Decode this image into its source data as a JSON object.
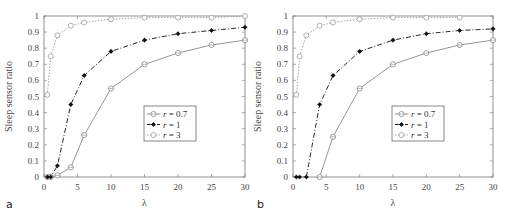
{
  "chart_data": [
    {
      "type": "line",
      "panel_label": "a",
      "title": "",
      "xlabel": "λ",
      "ylabel": "Sleep sensor ratio",
      "xlim": [
        0,
        30
      ],
      "ylim": [
        0,
        1
      ],
      "xticks": [
        "0",
        "5",
        "10",
        "15",
        "20",
        "25",
        "30"
      ],
      "yticks": [
        "0",
        "0.1",
        "0.2",
        "0.3",
        "0.4",
        "0.5",
        "0.6",
        "0.7",
        "0.8",
        "0.9",
        "1"
      ],
      "grid": false,
      "legend_position": "center-right",
      "series": [
        {
          "name": "r = 0.7",
          "r": "0.7",
          "style": "solid",
          "marker": "open-diamond-circle",
          "color": "#8a8a8a",
          "x": [
            0.5,
            1,
            2,
            4,
            6,
            10,
            15,
            20,
            25,
            30
          ],
          "values": [
            0,
            0,
            0.01,
            0.06,
            0.26,
            0.55,
            0.7,
            0.77,
            0.82,
            0.85
          ]
        },
        {
          "name": "r = 1",
          "r": "1",
          "style": "dashdot",
          "marker": "filled-star",
          "color": "#111111",
          "x": [
            0.5,
            1,
            2,
            4,
            6,
            10,
            15,
            20,
            25,
            30
          ],
          "values": [
            0,
            0,
            0.07,
            0.45,
            0.63,
            0.78,
            0.85,
            0.89,
            0.91,
            0.93
          ]
        },
        {
          "name": "r = 3",
          "r": "3",
          "style": "dotted",
          "marker": "open-circle",
          "color": "#9a9a9a",
          "x": [
            0.5,
            1,
            2,
            4,
            6,
            10,
            15,
            20,
            25,
            30
          ],
          "values": [
            0.51,
            0.75,
            0.88,
            0.94,
            0.96,
            0.98,
            0.99,
            0.99,
            0.99,
            1.0
          ]
        }
      ]
    },
    {
      "type": "line",
      "panel_label": "b",
      "title": "",
      "xlabel": "λ",
      "ylabel": "Sleep sensor ratio",
      "xlim": [
        0,
        30
      ],
      "ylim": [
        0,
        1
      ],
      "xticks": [
        "0",
        "5",
        "10",
        "15",
        "20",
        "25",
        "30"
      ],
      "yticks": [
        "0",
        "0.1",
        "0.2",
        "0.3",
        "0.4",
        "0.5",
        "0.6",
        "0.7",
        "0.8",
        "0.9",
        "1"
      ],
      "grid": false,
      "legend_position": "center-right",
      "series": [
        {
          "name": "r = 0.7",
          "r": "0.7",
          "style": "solid",
          "marker": "open-diamond-circle",
          "color": "#8a8a8a",
          "x": [
            4,
            6,
            10,
            15,
            20,
            25,
            30
          ],
          "values": [
            0,
            0.25,
            0.55,
            0.7,
            0.77,
            0.82,
            0.85
          ]
        },
        {
          "name": "r = 1",
          "r": "1",
          "style": "dashdot",
          "marker": "filled-star",
          "color": "#111111",
          "x": [
            0.5,
            1,
            2,
            4,
            6,
            10,
            15,
            20,
            25,
            30
          ],
          "values": [
            0,
            0,
            0,
            0.45,
            0.63,
            0.78,
            0.85,
            0.89,
            0.91,
            0.92
          ]
        },
        {
          "name": "r = 3",
          "r": "3",
          "style": "dotted",
          "marker": "open-circle",
          "color": "#9a9a9a",
          "x": [
            0.5,
            1,
            2,
            4,
            6,
            10,
            15,
            20,
            25
          ],
          "values": [
            0.51,
            0.75,
            0.88,
            0.94,
            0.96,
            0.98,
            0.99,
            0.99,
            0.99
          ]
        }
      ]
    }
  ]
}
